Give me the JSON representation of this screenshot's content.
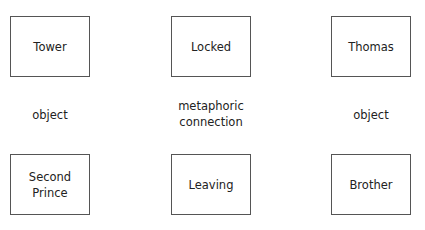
{
  "diagram": {
    "top_row": [
      {
        "label": "Tower"
      },
      {
        "label": "Locked"
      },
      {
        "label": "Thomas"
      }
    ],
    "middle_row": [
      {
        "label": "object"
      },
      {
        "label_line1": "metaphoric",
        "label_line2": "connection"
      },
      {
        "label": "object"
      }
    ],
    "bottom_row": [
      {
        "label_line1": "Second",
        "label_line2": "Prince"
      },
      {
        "label": "Leaving"
      },
      {
        "label": "Brother"
      }
    ]
  }
}
